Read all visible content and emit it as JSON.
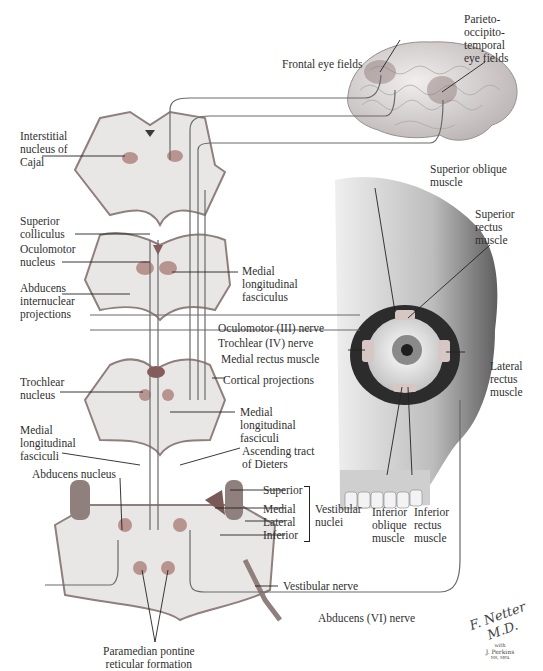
{
  "figure": {
    "signature": {
      "artist": "F. Netter M.D.",
      "with": "with",
      "coartist": "J. Perkins",
      "credentials": "MS, MFA"
    }
  },
  "brain": {
    "labels": {
      "frontal_eye_fields": "Frontal eye fields",
      "parieto_occipito_temporal": "Parieto-\noccipito-\ntemporal\neye fields"
    }
  },
  "midbrain_upper": {
    "labels": {
      "interstitial_nucleus": "Interstitial\nnucleus of\nCajal"
    }
  },
  "midbrain_lower": {
    "labels": {
      "superior_colliculus": "Superior\ncolliculus",
      "oculomotor_nucleus": "Oculomotor\nnucleus",
      "abducens_internuclear": "Abducens\ninternuclear\nprojections",
      "medial_longitudinal_fasciculus": "Medial\nlongitudinal\nfasciculus"
    }
  },
  "nerves": {
    "oculomotor": "Oculomotor (III) nerve",
    "trochlear": "Trochlear (IV) nerve",
    "abducens": "Abducens (VI) nerve",
    "vestibular": "Vestibular nerve"
  },
  "pons_upper": {
    "labels": {
      "trochlear_nucleus": "Trochlear\nnucleus",
      "cortical_projections": "Cortical projections",
      "medial_longitudinal_fasciculi_right": "Medial\nlongitudinal\nfasciculi",
      "medial_longitudinal_fasciculi_left": "Medial\nlongitudinal\nfasciculi",
      "ascending_tract": "Ascending tract\nof Dieters",
      "abducens_nucleus": "Abducens nucleus"
    }
  },
  "vestibular": {
    "nuclei": [
      "Superior",
      "Medial",
      "Lateral",
      "Inferior"
    ],
    "group_label": "Vestibular\nnuclei"
  },
  "pons_lower": {
    "labels": {
      "ppRF": "Paramedian pontine\nreticular formation"
    }
  },
  "eye": {
    "labels": {
      "superior_oblique": "Superior oblique\nmuscle",
      "superior_rectus": "Superior\nrectus\nmuscle",
      "medial_rectus": "Medial rectus muscle",
      "lateral_rectus": "Lateral\nrectus\nmuscle",
      "inferior_oblique": "Inferior\noblique\nmuscle",
      "inferior_rectus": "Inferior\nrectus\nmuscle"
    }
  },
  "colors": {
    "section_fill": "#e9e7e6",
    "section_edge": "#8f7f7d",
    "nucleus": "#b8948f",
    "pathway": "#6a6a6a",
    "skull_light": "#e8e6e6",
    "skull_dark": "#6f6f6f",
    "iris": "#8f8f8f"
  }
}
